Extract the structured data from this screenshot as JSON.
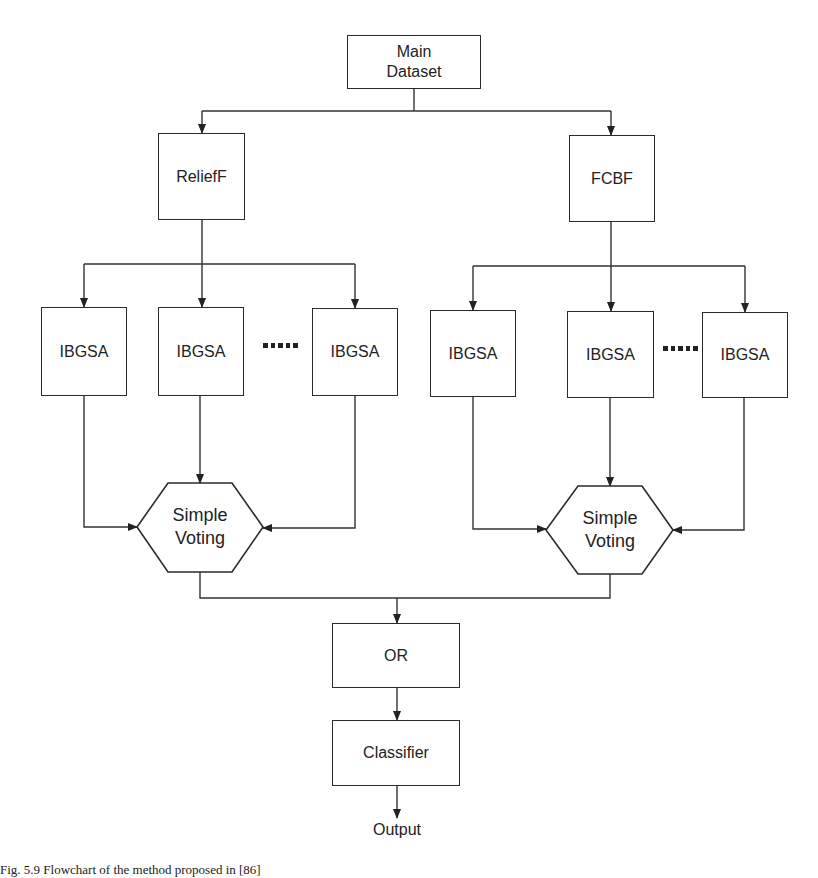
{
  "diagram": {
    "type": "flowchart",
    "nodes": {
      "main_dataset": {
        "label_line1": "Main",
        "label_line2": "Dataset"
      },
      "relieff": {
        "label": "ReliefF"
      },
      "fcbf": {
        "label": "FCBF"
      },
      "left_ibgsa": [
        {
          "label": "IBGSA"
        },
        {
          "label": "IBGSA"
        },
        {
          "label": "IBGSA"
        }
      ],
      "right_ibgsa": [
        {
          "label": "IBGSA"
        },
        {
          "label": "IBGSA"
        },
        {
          "label": "IBGSA"
        }
      ],
      "left_voting": {
        "label_line1": "Simple",
        "label_line2": "Voting"
      },
      "right_voting": {
        "label_line1": "Simple",
        "label_line2": "Voting"
      },
      "or": {
        "label": "OR"
      },
      "classifier": {
        "label": "Classifier"
      },
      "output": {
        "label": "Output"
      }
    },
    "ellipsis": "·····",
    "edges": [
      [
        "Main Dataset",
        "ReliefF"
      ],
      [
        "Main Dataset",
        "FCBF"
      ],
      [
        "ReliefF",
        "IBGSA (L1)"
      ],
      [
        "ReliefF",
        "IBGSA (L2)"
      ],
      [
        "ReliefF",
        "IBGSA (L3)"
      ],
      [
        "FCBF",
        "IBGSA (R1)"
      ],
      [
        "FCBF",
        "IBGSA (R2)"
      ],
      [
        "FCBF",
        "IBGSA (R3)"
      ],
      [
        "IBGSA (L1)",
        "Simple Voting (L)"
      ],
      [
        "IBGSA (L2)",
        "Simple Voting (L)"
      ],
      [
        "IBGSA (L3)",
        "Simple Voting (L)"
      ],
      [
        "IBGSA (R1)",
        "Simple Voting (R)"
      ],
      [
        "IBGSA (R2)",
        "Simple Voting (R)"
      ],
      [
        "IBGSA (R3)",
        "Simple Voting (R)"
      ],
      [
        "Simple Voting (L)",
        "OR"
      ],
      [
        "Simple Voting (R)",
        "OR"
      ],
      [
        "OR",
        "Classifier"
      ],
      [
        "Classifier",
        "Output"
      ]
    ]
  },
  "caption": "Fig. 5.9  Flowchart of the method proposed in [86]"
}
